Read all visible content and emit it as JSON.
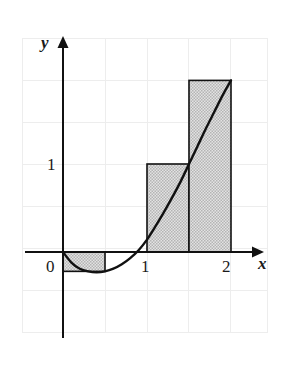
{
  "figure": {
    "name": "riemann-sum-right-endpoint-figure",
    "axis_labels": {
      "x": "x",
      "y": "y"
    },
    "x_ticks": [
      {
        "value": 0,
        "label": "0"
      },
      {
        "value": 1,
        "label": "1"
      },
      {
        "value": 2,
        "label": "2"
      }
    ],
    "y_ticks": [
      {
        "value": 1,
        "label": "1"
      }
    ],
    "colors": {
      "curve": "#111111",
      "axis": "#111111",
      "rect_fill": "#c9c9c9",
      "rect_stroke": "#111111",
      "grid": "#ededed",
      "background": "#ffffff"
    }
  },
  "chart_data": {
    "type": "area",
    "title": "",
    "subtitle": "",
    "xlabel": "x",
    "ylabel": "y",
    "xlim": [
      -1,
      2.5
    ],
    "ylim": [
      -1,
      2.5
    ],
    "grid": true,
    "grid_step": 0.5,
    "legend": null,
    "curve": {
      "name": "f(x)",
      "description": "upward-opening curve crossing the x-axis near x=0 and x=1, minimum near x=0.5",
      "x": [
        0.0,
        0.1,
        0.2,
        0.3,
        0.4,
        0.5,
        0.6,
        0.7,
        0.8,
        0.9,
        1.0,
        1.1,
        1.2,
        1.3,
        1.4,
        1.5,
        1.6,
        1.7,
        1.8,
        1.9,
        2.0
      ],
      "y": [
        0.0,
        -0.12,
        -0.19,
        -0.22,
        -0.23,
        -0.22,
        -0.19,
        -0.14,
        -0.07,
        0.02,
        0.14,
        0.29,
        0.45,
        0.62,
        0.8,
        1.0,
        1.2,
        1.4,
        1.59,
        1.78,
        1.95
      ]
    },
    "rectangles": {
      "method": "right endpoint",
      "n": 4,
      "dx": 0.5,
      "bars": [
        {
          "x_left": 0.0,
          "x_right": 0.5,
          "height": -0.22
        },
        {
          "x_left": 0.5,
          "x_right": 1.0,
          "height": 0.0
        },
        {
          "x_left": 1.0,
          "x_right": 1.5,
          "height": 1.0
        },
        {
          "x_left": 1.5,
          "x_right": 2.0,
          "height": 1.95
        }
      ]
    }
  }
}
